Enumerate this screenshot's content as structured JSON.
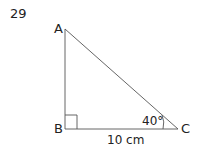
{
  "question_number": "29",
  "diagram": {
    "type": "right-triangle",
    "vertices": {
      "A": "A",
      "B": "B",
      "C": "C"
    },
    "right_angle_at": "B",
    "angle_label": "40°",
    "angle_at": "C",
    "side_label": "10 cm",
    "side": "BC",
    "line_color": "#555555"
  }
}
